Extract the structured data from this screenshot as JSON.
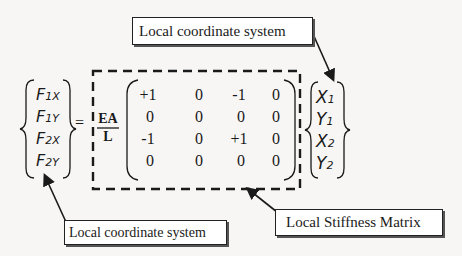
{
  "callouts": {
    "top": "Local coordinate system",
    "bottom_left": "Local coordinate system",
    "bottom_right": "Local Stiffness Matrix"
  },
  "force_vector": [
    {
      "base": "F",
      "sub": "1X"
    },
    {
      "base": "F",
      "sub": "1Y"
    },
    {
      "base": "F",
      "sub": "2X"
    },
    {
      "base": "F",
      "sub": "2Y"
    }
  ],
  "equals": "=",
  "coefficient": {
    "numerator": "EA",
    "denominator": "L"
  },
  "matrix": [
    [
      "+1",
      "0",
      "-1",
      "0"
    ],
    [
      "0",
      "0",
      "0",
      "0"
    ],
    [
      "-1",
      "0",
      "+1",
      "0"
    ],
    [
      "0",
      "0",
      "0",
      "0"
    ]
  ],
  "displacement_vector": [
    {
      "base": "X",
      "sub": "1"
    },
    {
      "base": "Y",
      "sub": "1"
    },
    {
      "base": "X",
      "sub": "2"
    },
    {
      "base": "Y",
      "sub": "2"
    }
  ],
  "colors": {
    "ink": "#1a1a1a",
    "background": "#f7f6f4",
    "callout_fill": "#ffffff",
    "shadow": "#555555"
  }
}
